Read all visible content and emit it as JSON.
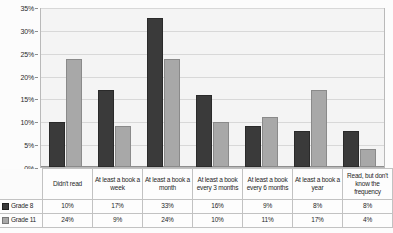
{
  "chart_data": {
    "type": "bar",
    "title": "",
    "subtitle": "",
    "xlabel": "",
    "ylabel": "",
    "ylim": [
      0,
      35
    ],
    "ytick_labels": [
      "0%",
      "5%",
      "10%",
      "15%",
      "20%",
      "25%",
      "30%",
      "35%"
    ],
    "ytick_values": [
      0,
      5,
      10,
      15,
      20,
      25,
      30,
      35
    ],
    "grid": true,
    "legend_position": "table-left",
    "categories": [
      "Didn't read",
      "At least a book a week",
      "At least a book a month",
      "At least a book every 3 months",
      "At least a book every 6 months",
      "At least a book a year",
      "Read, but don't know the frequency"
    ],
    "series": [
      {
        "name": "Grade 8",
        "color": "#3a3a3a",
        "values": [
          10,
          17,
          33,
          16,
          9,
          8,
          8
        ],
        "value_labels": [
          "10%",
          "17%",
          "33%",
          "16%",
          "9%",
          "8%",
          "8%"
        ]
      },
      {
        "name": "Grade 11",
        "color": "#a8a8a8",
        "values": [
          24,
          9,
          24,
          10,
          11,
          17,
          4
        ],
        "value_labels": [
          "24%",
          "9%",
          "24%",
          "10%",
          "11%",
          "17%",
          "4%"
        ]
      }
    ]
  }
}
